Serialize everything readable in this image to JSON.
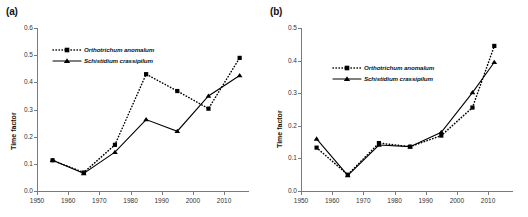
{
  "figure": {
    "panels": [
      {
        "id": "a",
        "label": "(a)",
        "ylabel": "Time factor",
        "xlabel": "",
        "legend": [
          {
            "name": "Orthotrichum anomalum",
            "marker": "square",
            "line": "dotted"
          },
          {
            "name": "Schistidium crassipilum",
            "marker": "triangle",
            "line": "solid"
          }
        ],
        "chart_data": {
          "type": "line",
          "title": "",
          "xlabel": "",
          "ylabel": "Time factor",
          "xlim": [
            1950,
            2018
          ],
          "ylim": [
            0.0,
            0.6
          ],
          "xticks": [
            1950,
            1960,
            1970,
            1980,
            1990,
            2000,
            2010
          ],
          "yticks": [
            0.0,
            0.1,
            0.2,
            0.3,
            0.4,
            0.5,
            0.6
          ],
          "ytick_labels": [
            "0.0",
            "0.1",
            "0.2",
            "0.3",
            "0.4",
            "0.5",
            "0.6"
          ],
          "xtick_labels": [
            "1950",
            "1960",
            "1970",
            "1980",
            "1990",
            "2000",
            "2010"
          ],
          "grid": false,
          "legend_position": "upper-left",
          "x": [
            1955,
            1965,
            1975,
            1985,
            1995,
            2005,
            2015
          ],
          "series": [
            {
              "name": "Orthotrichum anomalum",
              "marker": "square",
              "linestyle": "dotted",
              "color": "#000000",
              "values": [
                0.113,
                0.068,
                0.17,
                0.43,
                0.368,
                0.303,
                0.49
              ]
            },
            {
              "name": "Schistidium crassipilum",
              "marker": "triangle",
              "linestyle": "solid",
              "color": "#000000",
              "values": [
                0.113,
                0.065,
                0.143,
                0.263,
                0.22,
                0.35,
                0.425
              ]
            }
          ]
        }
      },
      {
        "id": "b",
        "label": "(b)",
        "ylabel": "Time factor",
        "xlabel": "",
        "legend": [
          {
            "name": "Orthotrichum anomalum",
            "marker": "square",
            "line": "dotted"
          },
          {
            "name": "Schistidium crassipilum",
            "marker": "triangle",
            "line": "solid"
          }
        ],
        "chart_data": {
          "type": "line",
          "title": "",
          "xlabel": "",
          "ylabel": "Time factor",
          "xlim": [
            1950,
            2018
          ],
          "ylim": [
            0.0,
            0.5
          ],
          "xticks": [
            1950,
            1960,
            1970,
            1980,
            1990,
            2000,
            2010
          ],
          "yticks": [
            0.0,
            0.1,
            0.2,
            0.3,
            0.4,
            0.5
          ],
          "ytick_labels": [
            "0.0",
            "0.1",
            "0.2",
            "0.3",
            "0.4",
            "0.5"
          ],
          "xtick_labels": [
            "1950",
            "1960",
            "1970",
            "1980",
            "1990",
            "2000",
            "2010"
          ],
          "grid": false,
          "legend_position": "upper-left",
          "x": [
            1955,
            1965,
            1975,
            1985,
            1995,
            2005,
            2012
          ],
          "series": [
            {
              "name": "Orthotrichum anomalum",
              "marker": "square",
              "linestyle": "dotted",
              "color": "#000000",
              "values": [
                0.133,
                0.05,
                0.147,
                0.136,
                0.17,
                0.256,
                0.445
              ]
            },
            {
              "name": "Schistidium crassipilum",
              "marker": "triangle",
              "linestyle": "solid",
              "color": "#000000",
              "values": [
                0.16,
                0.048,
                0.141,
                0.136,
                0.18,
                0.302,
                0.395
              ]
            }
          ]
        }
      }
    ]
  }
}
